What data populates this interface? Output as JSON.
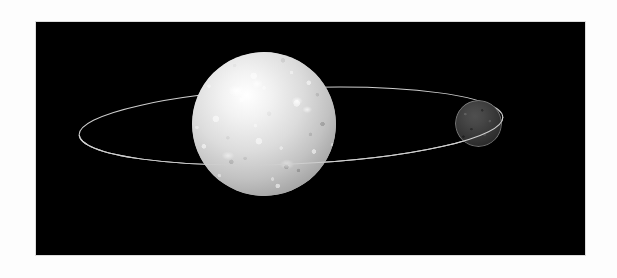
{
  "scene": {
    "title": "Orbital diagram: bright primary body with small dark companion on an elliptical orbit",
    "canvas_width": 617,
    "canvas_height": 278,
    "canvas_background": "#fdfdfd",
    "panel": {
      "label": "image-panel",
      "x": 36,
      "y": 22,
      "width": 549,
      "height": 233,
      "background": "#000000",
      "border_color": "#dcdcdc"
    },
    "primary_body": {
      "label": "primary-body",
      "description": "large bright mottled sphere",
      "center_x": 264,
      "center_y": 124,
      "diameter": 144,
      "highlight_color": "#ffffff",
      "mid_color": "#c2c2c2",
      "limb_color": "#3a3a3a"
    },
    "secondary_body": {
      "label": "secondary-body",
      "description": "small dark gray sphere at right",
      "center_x": 478,
      "center_y": 123,
      "diameter": 47,
      "fill_color": "#3b3b3b",
      "rim_color": "#bebebe"
    },
    "orbit": {
      "label": "orbit-ellipse",
      "center_x": 291,
      "center_y": 126,
      "semi_major": 212,
      "semi_minor": 38,
      "tilt_degrees": -2.4,
      "stroke_color": "#cfcfcf",
      "stroke_width": 1
    }
  }
}
